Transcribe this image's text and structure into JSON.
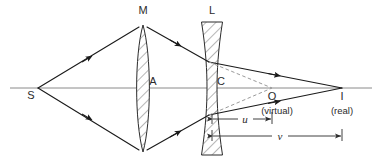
{
  "figure": {
    "colors": {
      "ink": "#2b2b2b",
      "axis": "#8a8a8a",
      "ray": "#1a1a1a",
      "dashed": "#9a9a9a",
      "hatch": "#4a4a4a",
      "background": "#ffffff"
    },
    "axis": {
      "y": 88,
      "x_start": 10,
      "x_end": 372
    }
  },
  "labels": {
    "source": "S",
    "lens_m": "M",
    "lens_m_center": "A",
    "lens_l": "L",
    "lens_l_center": "C",
    "virtual_point": "O",
    "virtual_note": "(virtual)",
    "image_point": "I",
    "image_note": "(real)",
    "dim_u": "u",
    "dim_v": "v"
  },
  "points": {
    "S": {
      "x": 38,
      "y": 88
    },
    "A": {
      "x": 143,
      "y": 88
    },
    "C": {
      "x": 212,
      "y": 88
    },
    "O": {
      "x": 272,
      "y": 88
    },
    "I": {
      "x": 342,
      "y": 88
    }
  },
  "label_positions": {
    "S": {
      "x": 31,
      "y": 97
    },
    "M": {
      "x": 139,
      "y": 13
    },
    "A": {
      "x": 150,
      "y": 85
    },
    "L": {
      "x": 208,
      "y": 13
    },
    "C": {
      "x": 218,
      "y": 85
    },
    "O": {
      "x": 270,
      "y": 98
    },
    "virtual_note": {
      "x": 254,
      "y": 112
    },
    "I": {
      "x": 339,
      "y": 98
    },
    "real_note": {
      "x": 326,
      "y": 112
    },
    "u": {
      "x": 245,
      "y": 122
    },
    "v": {
      "x": 280,
      "y": 139
    }
  },
  "lens_m": {
    "type": "biconvex",
    "center_x": 143,
    "top_y": 25,
    "bottom_y": 152,
    "half_thickness": 7.5,
    "hatch_lines": 13
  },
  "lens_l": {
    "type": "biconcave",
    "center_x": 212,
    "top_y": 22,
    "bottom_y": 155,
    "edge_half_width": 10.5,
    "waist_half_width": 5.0,
    "hatch_lines": 14
  },
  "rays": [
    {
      "name": "ray-upper-incident",
      "from_x": 38,
      "from_y": 88,
      "to_x": 139,
      "to_y": 27,
      "arrow_t": 0.49,
      "style": "solid"
    },
    {
      "name": "ray-lower-incident",
      "from_x": 38,
      "from_y": 88,
      "to_x": 139,
      "to_y": 150,
      "arrow_t": 0.49,
      "style": "solid"
    },
    {
      "name": "ray-upper-between",
      "from_x": 147,
      "from_y": 27,
      "to_x": 208,
      "to_y": 62,
      "arrow_t": 0.5,
      "style": "solid"
    },
    {
      "name": "ray-lower-between",
      "from_x": 147,
      "from_y": 150,
      "to_x": 208,
      "to_y": 115,
      "arrow_t": 0.5,
      "style": "solid"
    },
    {
      "name": "ray-upper-refracted",
      "from_x": 208,
      "from_y": 62,
      "to_x": 342,
      "to_y": 88,
      "arrow_t": 0.52,
      "style": "solid"
    },
    {
      "name": "ray-lower-refracted",
      "from_x": 208,
      "from_y": 115,
      "to_x": 342,
      "to_y": 88,
      "arrow_t": 0.52,
      "style": "solid"
    },
    {
      "name": "virtual-ray-upper",
      "from_x": 208,
      "from_y": 62,
      "to_x": 272,
      "to_y": 88,
      "arrow_t": null,
      "style": "dashed"
    },
    {
      "name": "virtual-ray-lower",
      "from_x": 208,
      "from_y": 115,
      "to_x": 272,
      "to_y": 88,
      "arrow_t": null,
      "style": "dashed"
    }
  ],
  "dimensions": [
    {
      "name": "dimension-u",
      "from_x": 212,
      "to_x": 272,
      "y": 119,
      "label": "u"
    },
    {
      "name": "dimension-v",
      "from_x": 212,
      "to_x": 342,
      "y": 136,
      "label": "v"
    }
  ]
}
